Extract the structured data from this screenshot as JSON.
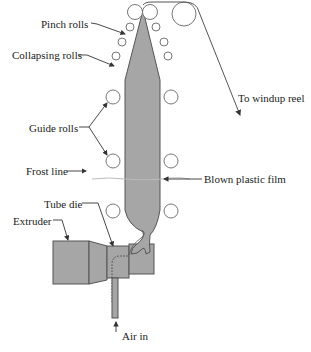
{
  "diagram": {
    "type": "process-schematic",
    "colors": {
      "fill": "#a6a6a6",
      "stroke": "#555555",
      "roll_stroke": "#777777",
      "label_text": "#222222",
      "frost_line": "#bbbbbb"
    },
    "labels": {
      "pinch_rolls": "Pinch rolls",
      "collapsing_rolls": "Collapsing rolls",
      "guide_rolls": "Guide rolls",
      "frost_line": "Frost line",
      "tube_die": "Tube die",
      "extruder": "Extruder",
      "windup": "To windup reel",
      "blown_film": "Blown plastic film",
      "air_in": "Air in"
    }
  }
}
